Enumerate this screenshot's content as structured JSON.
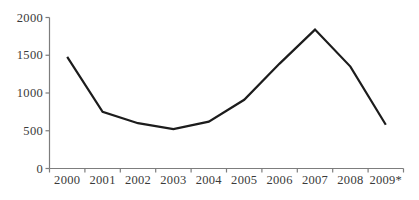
{
  "chart_data": {
    "type": "line",
    "categories": [
      "2000",
      "2001",
      "2002",
      "2003",
      "2004",
      "2005",
      "2006",
      "2007",
      "2008",
      "2009*"
    ],
    "values": [
      1480,
      750,
      600,
      520,
      620,
      910,
      1390,
      1840,
      1350,
      580
    ],
    "title": "",
    "xlabel": "",
    "ylabel": "",
    "ylim": [
      0,
      2000
    ],
    "yticks": [
      0,
      500,
      1000,
      1500,
      2000
    ],
    "ytick_labels": [
      "0",
      "500",
      "1000",
      "1500",
      "2000"
    ],
    "grid": false,
    "legend": "none",
    "series_name": ""
  },
  "colors": {
    "background": "#ffffff",
    "line": "#1c1c1c",
    "axis": "#7d7d7d",
    "label": "#3a3a3a"
  }
}
